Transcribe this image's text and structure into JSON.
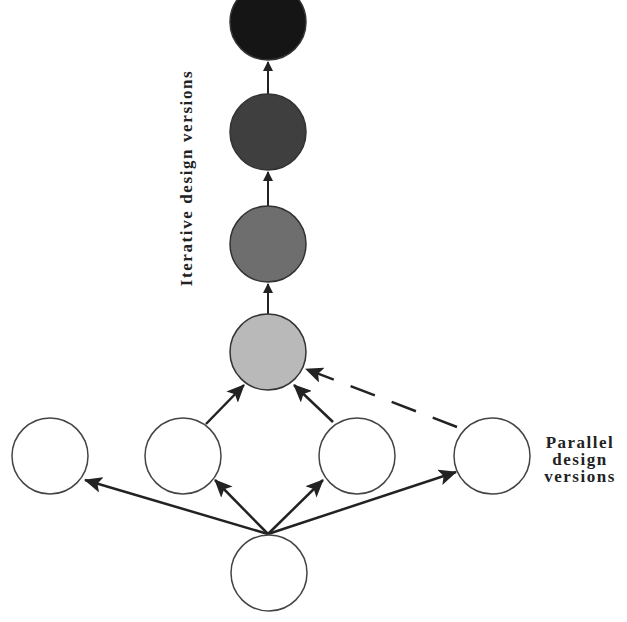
{
  "labels": {
    "iterative": "Iterative design versions",
    "parallel_line1": "Parallel",
    "parallel_line2": "design",
    "parallel_line3": "versions"
  },
  "iterative_nodes": [
    {
      "id": "iter-4",
      "fill": "#151515",
      "cx": 268,
      "cy": 22
    },
    {
      "id": "iter-3",
      "fill": "#3f3f3f",
      "cx": 268,
      "cy": 132
    },
    {
      "id": "iter-2",
      "fill": "#6e6e6e",
      "cx": 268,
      "cy": 244
    },
    {
      "id": "iter-1",
      "fill": "#b9b9b9",
      "cx": 268,
      "cy": 352
    }
  ],
  "parallel_nodes": [
    {
      "id": "par-1",
      "cx": 50,
      "cy": 456
    },
    {
      "id": "par-2",
      "cx": 183,
      "cy": 456
    },
    {
      "id": "par-3",
      "cx": 357,
      "cy": 456
    },
    {
      "id": "par-4",
      "cx": 492,
      "cy": 456
    }
  ],
  "root_node": {
    "id": "root",
    "cx": 269,
    "cy": 573
  },
  "colors": {
    "stroke": "#333333",
    "parallel_fill": "#ffffff"
  }
}
